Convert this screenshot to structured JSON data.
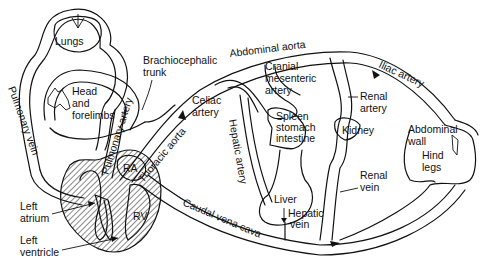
{
  "diagram": {
    "type": "circulatory-system-schematic",
    "labels": {
      "lungs": "Lungs",
      "head_forelimbs_1": "Head",
      "head_forelimbs_2": "and",
      "head_forelimbs_3": "forelimbs",
      "pulmonary_vein": "Pulmonary vein",
      "pulmonary_artery": "Pulmonary artery",
      "brachiocephalic_1": "Brachiocephalic",
      "brachiocephalic_2": "trunk",
      "abdominal_aorta": "Abdominal aorta",
      "thoracic_aorta": "Thoracic aorta",
      "celiac_1": "Celiac",
      "celiac_2": "artery",
      "cranial_mesenteric_1": "Cranial",
      "cranial_mesenteric_2": "mesenteric",
      "cranial_mesenteric_3": "artery",
      "spleen_1": "Spleen",
      "spleen_2": "stomach",
      "spleen_3": "intestine",
      "hepatic_artery": "Hepatic artery",
      "liver": "Liver",
      "hepatic_vein_1": "Hepatic",
      "hepatic_vein_2": "vein",
      "iliac_artery": "Iliac artery",
      "renal_artery_1": "Renal",
      "renal_artery_2": "artery",
      "kidney": "Kidney",
      "renal_vein_1": "Renal",
      "renal_vein_2": "vein",
      "abdominal_wall_1": "Abdominal",
      "abdominal_wall_2": "wall",
      "hind_legs_1": "Hind",
      "hind_legs_2": "legs",
      "caudal_vena_cava": "Caudal vena cava",
      "ra": "RA",
      "rv": "RV",
      "left_atrium_1": "Left",
      "left_atrium_2": "atrium",
      "left_ventricle_1": "Left",
      "left_ventricle_2": "ventricle"
    }
  }
}
